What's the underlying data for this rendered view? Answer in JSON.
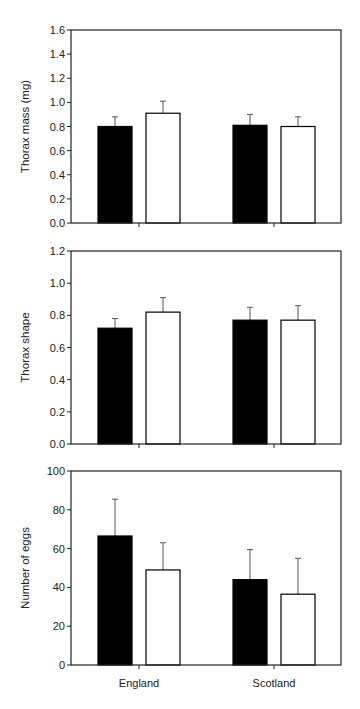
{
  "chart_data": [
    {
      "type": "bar",
      "title": "",
      "xlabel": "",
      "ylabel": "Thorax mass (mg)",
      "categories": [
        "England",
        "Scotland"
      ],
      "ylim": [
        0,
        1.6
      ],
      "yticks": [
        "0.0",
        "0.2",
        "0.4",
        "0.6",
        "0.8",
        "1.0",
        "1.2",
        "1.4",
        "1.6"
      ],
      "grid": false,
      "series": [
        {
          "name": "filled",
          "color": "#000000",
          "values": [
            0.8,
            0.81
          ],
          "error_upper": [
            0.88,
            0.9
          ]
        },
        {
          "name": "open",
          "color": "#ffffff",
          "values": [
            0.91,
            0.8
          ],
          "error_upper": [
            1.01,
            0.88
          ]
        }
      ]
    },
    {
      "type": "bar",
      "title": "",
      "xlabel": "",
      "ylabel": "Thorax shape",
      "categories": [
        "England",
        "Scotland"
      ],
      "ylim": [
        0,
        1.2
      ],
      "yticks": [
        "0.0",
        "0.2",
        "0.4",
        "0.6",
        "0.8",
        "1.0",
        "1.2"
      ],
      "grid": false,
      "series": [
        {
          "name": "filled",
          "color": "#000000",
          "values": [
            0.72,
            0.77
          ],
          "error_upper": [
            0.78,
            0.85
          ]
        },
        {
          "name": "open",
          "color": "#ffffff",
          "values": [
            0.82,
            0.77
          ],
          "error_upper": [
            0.91,
            0.86
          ]
        }
      ]
    },
    {
      "type": "bar",
      "title": "",
      "xlabel": "",
      "ylabel": "Number of eggs",
      "categories": [
        "England",
        "Scotland"
      ],
      "ylim": [
        0,
        100
      ],
      "yticks": [
        "0",
        "20",
        "40",
        "60",
        "80",
        "100"
      ],
      "grid": false,
      "series": [
        {
          "name": "filled",
          "color": "#000000",
          "values": [
            66.5,
            44
          ],
          "error_upper": [
            85.5,
            59.5
          ]
        },
        {
          "name": "open",
          "color": "#ffffff",
          "values": [
            49,
            36.5
          ],
          "error_upper": [
            63,
            55
          ]
        }
      ]
    }
  ]
}
